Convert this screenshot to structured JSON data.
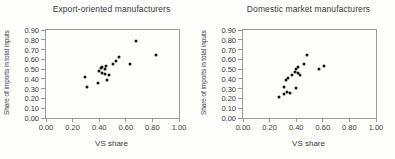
{
  "figure": {
    "background": "#fdfdfc",
    "text_color": "#3a3a3a",
    "frame_color": "#9a9a9a",
    "point_color": "#161616"
  },
  "chart_data": [
    {
      "type": "scatter",
      "title": "Export-oriented manufacturers",
      "xlabel": "VS share",
      "ylabel": "Share of imports in total inputs",
      "xlim": [
        0.0,
        1.0
      ],
      "ylim": [
        0.0,
        0.9
      ],
      "xticks": [
        "0.00",
        "0.20",
        "0.40",
        "0.60",
        "0.80",
        "1.00"
      ],
      "yticks": [
        "0.00",
        "0.10",
        "0.20",
        "0.30",
        "0.40",
        "0.50",
        "0.60",
        "0.70",
        "0.80",
        "0.90"
      ],
      "grid": false,
      "legend": false,
      "points": [
        [
          0.29,
          0.42
        ],
        [
          0.31,
          0.32
        ],
        [
          0.39,
          0.36
        ],
        [
          0.4,
          0.48
        ],
        [
          0.41,
          0.51
        ],
        [
          0.42,
          0.46
        ],
        [
          0.42,
          0.52
        ],
        [
          0.44,
          0.45
        ],
        [
          0.44,
          0.5
        ],
        [
          0.45,
          0.53
        ],
        [
          0.46,
          0.39
        ],
        [
          0.47,
          0.44
        ],
        [
          0.5,
          0.55
        ],
        [
          0.53,
          0.58
        ],
        [
          0.55,
          0.62
        ],
        [
          0.63,
          0.55
        ],
        [
          0.68,
          0.79
        ],
        [
          0.83,
          0.64
        ]
      ]
    },
    {
      "type": "scatter",
      "title": "Domestic market manufacturers",
      "xlabel": "VS share",
      "ylabel": "Share of imports in total inputs",
      "xlim": [
        0.0,
        1.0
      ],
      "ylim": [
        0.0,
        0.9
      ],
      "xticks": [
        "0.00",
        "0.20",
        "0.40",
        "0.60",
        "0.80",
        "1.00"
      ],
      "yticks": [
        "0.00",
        "0.10",
        "0.20",
        "0.30",
        "0.40",
        "0.50",
        "0.60",
        "0.70",
        "0.80",
        "0.90"
      ],
      "grid": false,
      "legend": false,
      "points": [
        [
          0.27,
          0.21
        ],
        [
          0.31,
          0.25
        ],
        [
          0.33,
          0.27
        ],
        [
          0.35,
          0.26
        ],
        [
          0.31,
          0.32
        ],
        [
          0.4,
          0.31
        ],
        [
          0.32,
          0.39
        ],
        [
          0.34,
          0.41
        ],
        [
          0.37,
          0.44
        ],
        [
          0.39,
          0.47
        ],
        [
          0.41,
          0.46
        ],
        [
          0.43,
          0.44
        ],
        [
          0.4,
          0.5
        ],
        [
          0.41,
          0.52
        ],
        [
          0.46,
          0.55
        ],
        [
          0.48,
          0.64
        ],
        [
          0.57,
          0.5
        ],
        [
          0.61,
          0.53
        ]
      ]
    }
  ]
}
